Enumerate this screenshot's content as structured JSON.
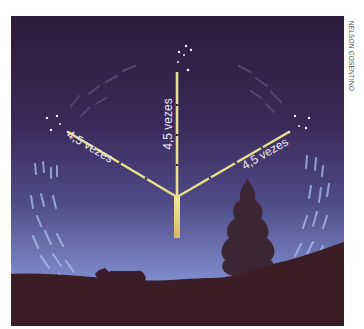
{
  "figure": {
    "credit": "NELSON COSENTINO",
    "labels": {
      "vertical": "4,5 vezes",
      "left": "4,5 vezes",
      "right": "4,5 vezes"
    },
    "colors": {
      "sky_top": "#2e1a3c",
      "sky_mid": "#3f3468",
      "sky_bottom": "#8fa0d8",
      "ground": "#3a1d25",
      "pointer": "#e8e089",
      "star_trail": "#bcd3f4",
      "label_text": "#e9e6f4"
    },
    "elements": [
      "star-pointer-vertical",
      "star-pointer-left",
      "star-pointer-right",
      "star-cluster-top",
      "star-cluster-left",
      "star-cluster-right",
      "cow-silhouette",
      "tree-silhouette",
      "hill-ground",
      "star-trails"
    ]
  }
}
